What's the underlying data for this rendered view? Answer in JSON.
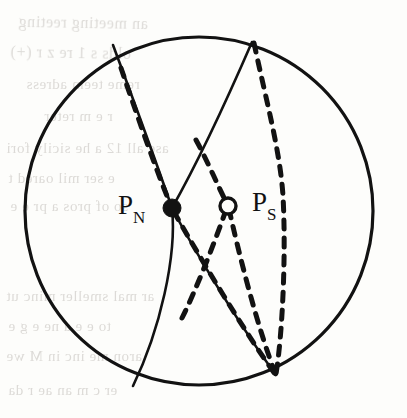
{
  "figure": {
    "caption_present": false,
    "background_color": "#fdfdfb",
    "ink_color": "#121212",
    "bleed_color": "#bdb9b4",
    "sphere": {
      "name": "sphere-outline",
      "center_x": 199,
      "center_y": 211,
      "radius": 174,
      "stroke_width": 3.2
    },
    "labels": [
      {
        "id": "p-n",
        "base": "P",
        "subscript": "N",
        "x": 118,
        "y": 192,
        "marker": "filled-dot",
        "marker_x": 172,
        "marker_y": 208,
        "marker_radius": 9
      },
      {
        "id": "p-s",
        "base": "P",
        "subscript": "S",
        "x": 252,
        "y": 189,
        "marker": "open-circle",
        "marker_x": 228,
        "marker_y": 206,
        "marker_radius": 8
      }
    ],
    "curves": [
      {
        "id": "solid-meridian-left",
        "style": "solid",
        "description": "great circle arc from upper-left rim through P_N to lower rim",
        "path": "M 113 45 C 132 96, 152 150, 172 208 C 177 256, 160 330, 133 386"
      },
      {
        "id": "solid-meridian-right",
        "style": "solid",
        "description": "great circle arc from top rim through P_N to lower-right rim",
        "path": "M 252 42 C 229 95, 198 162, 172 208 C 196 254, 243 330, 276 375"
      },
      {
        "id": "dashed-meridian-outer",
        "style": "dashed",
        "description": "dashed great circle arc from top rim through right side to lower-right rim",
        "path": "M 254 43 C 266 100, 280 150, 283 196 C 286 250, 283 330, 276 374"
      },
      {
        "id": "dashed-arc-upper-left-to-ps",
        "style": "dashed",
        "description": "dashed arc descending from upper area into the open circle P_S",
        "path": "M 196 140 C 206 158, 218 186, 228 206"
      },
      {
        "id": "dashed-arc-ps-to-rim",
        "style": "dashed",
        "description": "dashed arc from open circle P_S down to lower-right rim",
        "path": "M 229 209 C 238 250, 258 330, 276 375"
      },
      {
        "id": "dashed-arc-ps-to-pn-lower",
        "style": "dashed",
        "description": "dashed arc from P_S down-left merging with the solid arc toward lower rim",
        "path": "M 226 210 C 214 244, 196 290, 182 318"
      },
      {
        "id": "dashed-overlay-pn-upper",
        "style": "dashed",
        "description": "dashed overlay tracing the left solid arc above P_N",
        "path": "M 121 68 C 137 115, 155 167, 171 206"
      },
      {
        "id": "dashed-overlay-pn-lower",
        "style": "dashed",
        "description": "dashed overlay tracing the right solid arc below P_N",
        "path": "M 174 212 C 199 256, 244 331, 275 374"
      }
    ],
    "bleed_text": [
      {
        "text": "an meeting reeting",
        "x": 18,
        "y": 14,
        "size": 16,
        "rot": -1
      },
      {
        "text": "olds  s  1 re z  r (+)",
        "x": 10,
        "y": 44,
        "size": 16,
        "rot": -1
      },
      {
        "text": "reme teem adress",
        "x": 26,
        "y": 76,
        "size": 15,
        "rot": 0
      },
      {
        "text": "r  e    m   reter",
        "x": 44,
        "y": 108,
        "size": 15,
        "rot": 0
      },
      {
        "text": "ase all 12 a  he sicily fori",
        "x": 6,
        "y": 140,
        "size": 15,
        "rot": 0
      },
      {
        "text": "e  ser  mil   oared  t",
        "x": 8,
        "y": 170,
        "size": 15,
        "rot": 0
      },
      {
        "text": "so of pros   a  pr  e  e",
        "x": 10,
        "y": 198,
        "size": 15,
        "rot": 0
      },
      {
        "text": "ar   mal  smeller minc  ut",
        "x": 6,
        "y": 288,
        "size": 15,
        "rot": 0
      },
      {
        "text": "to  e   e  a  ne  e  g   e",
        "x": 8,
        "y": 318,
        "size": 15,
        "rot": 0
      },
      {
        "text": "aron  me  inc in   M  we",
        "x": 6,
        "y": 348,
        "size": 15,
        "rot": 0
      },
      {
        "text": "er  c  m  an  ae   r  da",
        "x": 8,
        "y": 382,
        "size": 15,
        "rot": 0
      }
    ]
  }
}
